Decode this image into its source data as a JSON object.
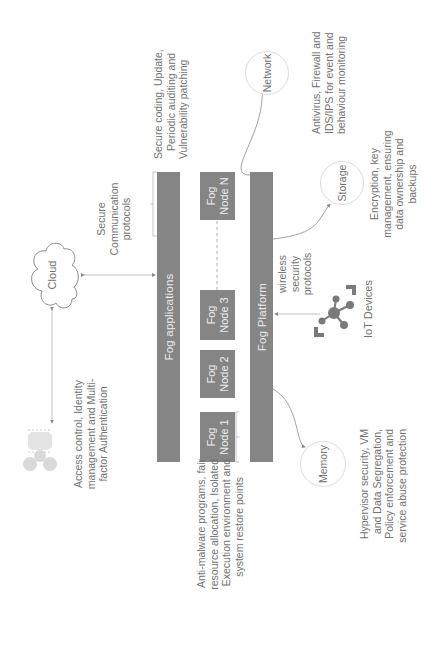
{
  "diagram": {
    "layers": {
      "fog_applications": "Fog applications",
      "fog_platform": "Fog Platform"
    },
    "fog_nodes": [
      {
        "line1": "Fog",
        "line2": "Node 1"
      },
      {
        "line1": "Fog",
        "line2": "Node 2"
      },
      {
        "line1": "Fog",
        "line2": "Node 3"
      },
      {
        "line1": "Fog",
        "line2": "Node N"
      }
    ],
    "entities": {
      "cloud": "Cloud",
      "network": "Network",
      "storage": "Storage",
      "memory": "Memory",
      "iot_devices": "IoT Devices"
    },
    "connection_labels": {
      "cloud_to_apps": [
        "Secure",
        "Communication",
        "protocols"
      ],
      "iot_to_platform": [
        "wireless",
        "security",
        "protocols"
      ]
    },
    "annotations": {
      "applications": [
        "Secure coding, Update,",
        "Periodic auditing and",
        "Vulnerability patching"
      ],
      "nodes": [
        "Anti-malware programs, fair",
        "resource allocation, Isolated",
        "Execution environment and",
        "system restore points"
      ],
      "users": [
        "Access control, Identity",
        "management and Multi-",
        "factor Authentication"
      ],
      "network": [
        "Antivirus, Firewall and",
        "IDS/IPS for event and",
        "behaviour monitoring"
      ],
      "storage": [
        "Encryption, key",
        "management, ensuring",
        "data ownership and",
        "backups"
      ],
      "memory": [
        "Hypervisor security, VM",
        "and Data Segregation,",
        "Policy enforcement and",
        "service abuse protection"
      ]
    },
    "colors": {
      "bar_fill": "#858585",
      "bar_text": "#e9e9e9",
      "text": "#727272",
      "line": "#9a9a9a",
      "circle_border": "#dcdcdc",
      "icon": "#7a7a7a",
      "users_icon": "#d9d9d9"
    }
  }
}
